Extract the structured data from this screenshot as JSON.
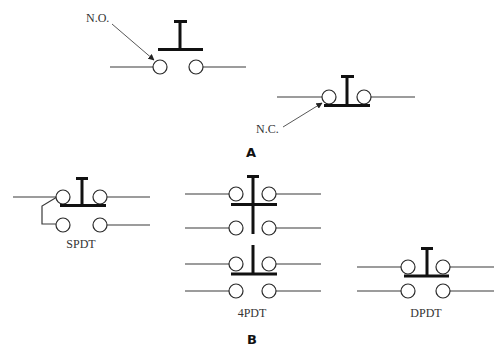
{
  "figure": {
    "panel_a": {
      "label": "A",
      "switches": [
        {
          "name": "normally-open",
          "callout": "N.O."
        },
        {
          "name": "normally-closed",
          "callout": "N.C."
        }
      ]
    },
    "panel_b": {
      "label": "B",
      "switches": [
        {
          "name": "spdt",
          "caption": "SPDT"
        },
        {
          "name": "4pdt",
          "caption": "4PDT"
        },
        {
          "name": "dpdt",
          "caption": "DPDT"
        }
      ]
    }
  }
}
